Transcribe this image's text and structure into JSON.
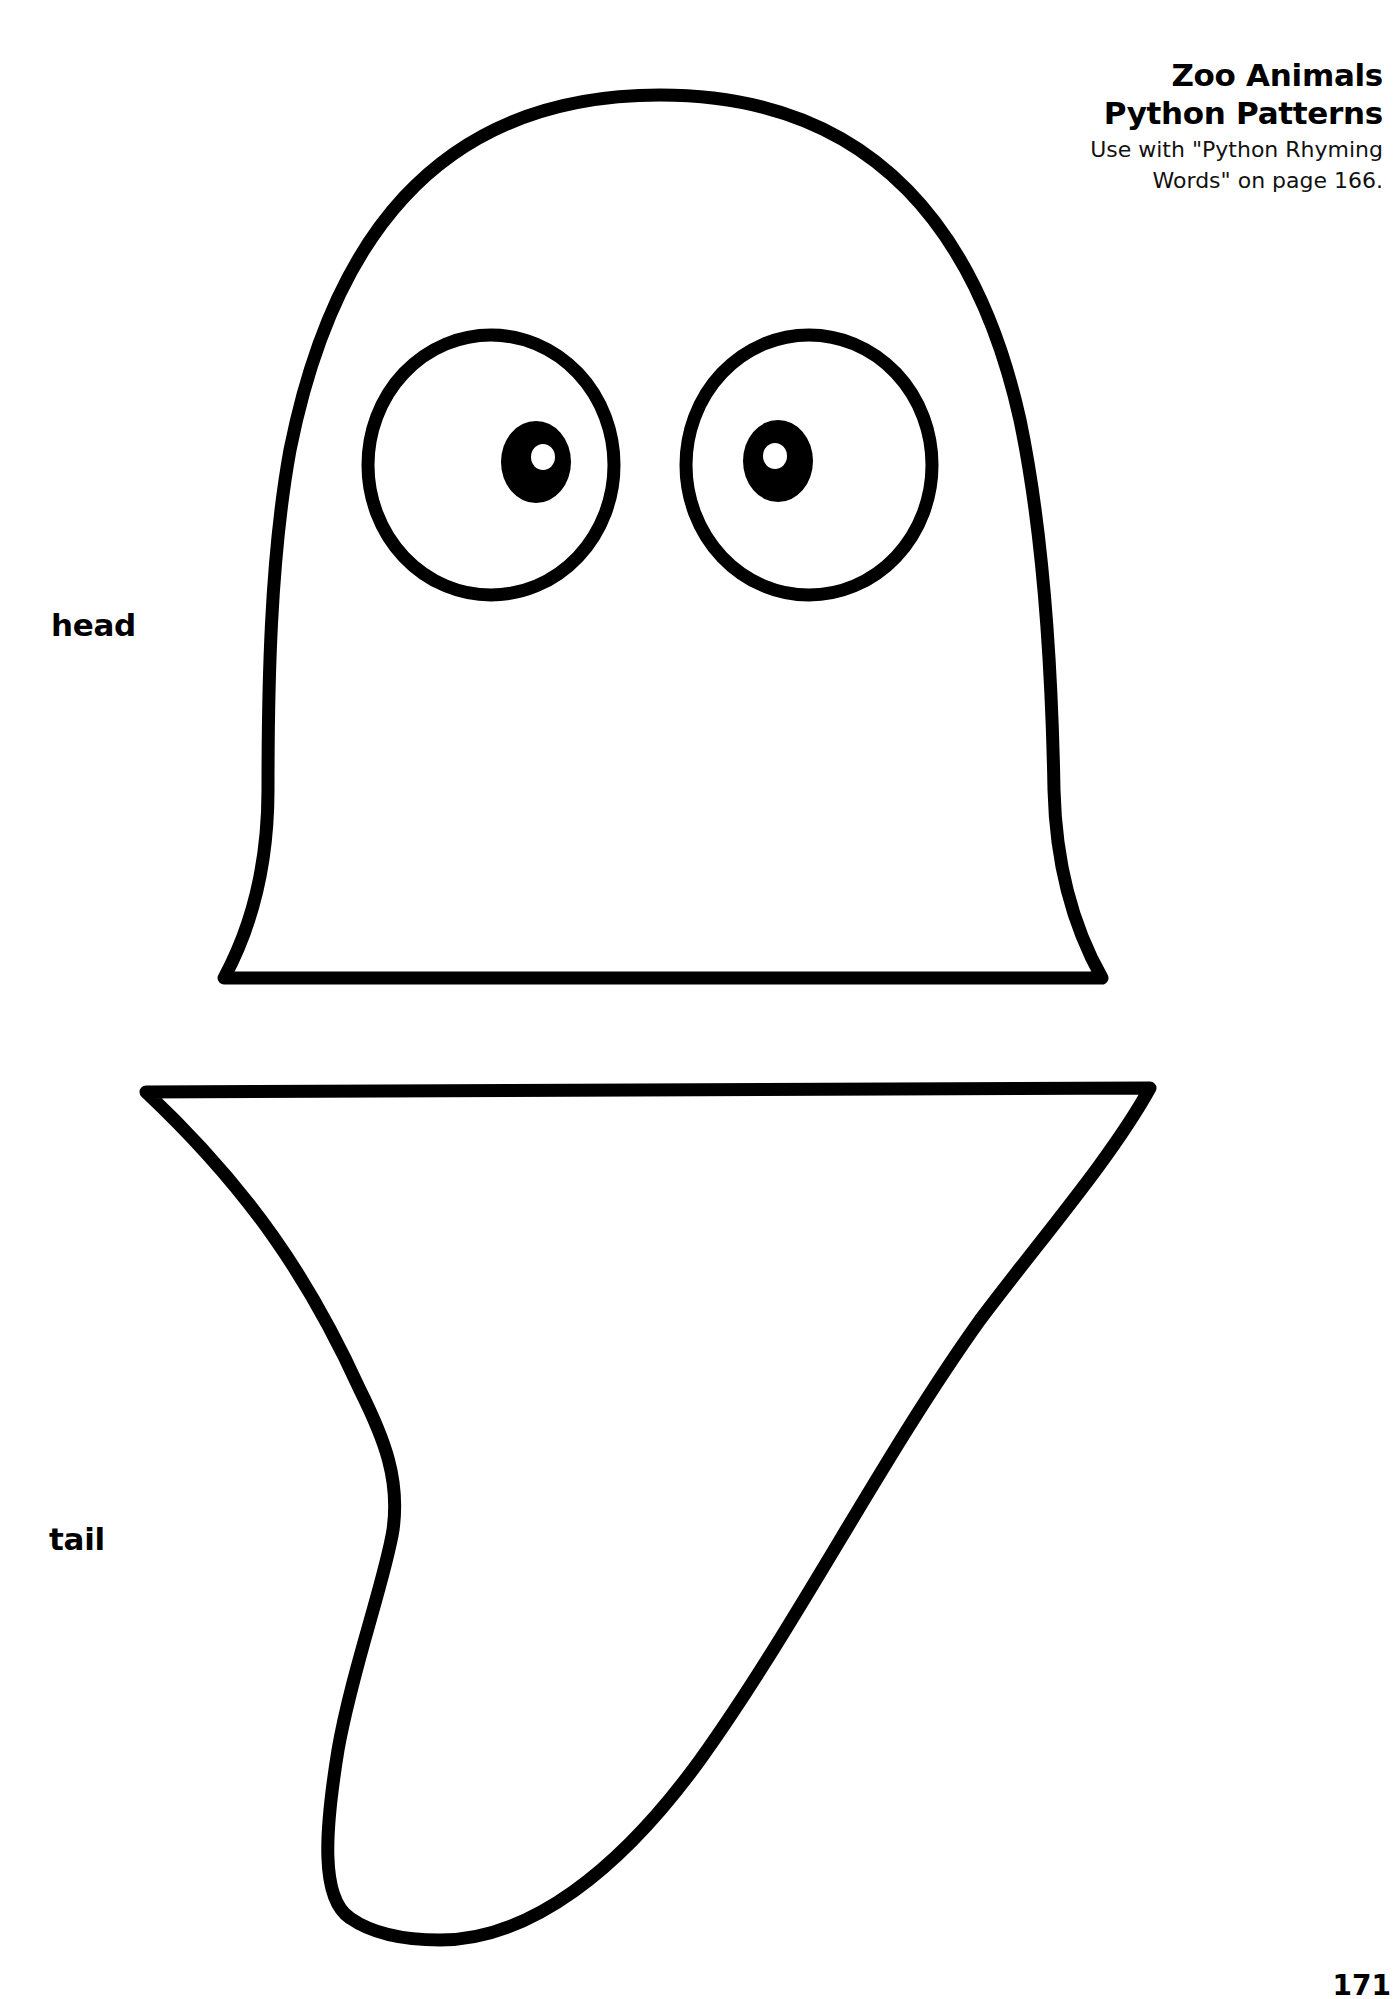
{
  "header": {
    "title_line1": "Zoo Animals",
    "title_line2": "Python Patterns",
    "subtitle_line1": "Use with \"Python Rhyming",
    "subtitle_line2": "Words\" on page 166."
  },
  "patterns": {
    "head_label": "head",
    "tail_label": "tail"
  },
  "footer": {
    "page_number": "171"
  },
  "colors": {
    "ink": "#000000",
    "paper": "#ffffff"
  }
}
